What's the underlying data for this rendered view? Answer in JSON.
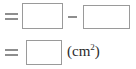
{
  "worksheet": {
    "name": "area-subtraction-answer-blanks",
    "background_color": "#ffffff",
    "box_border_color": "#9a9a9a",
    "operator_color": "#8e8e8e",
    "text_color": "#2b2b2b",
    "rows": [
      {
        "id": "equation-row-1",
        "equals_symbol": "=",
        "operator_symbol": "−",
        "operator_name": "minus-sign",
        "boxes": [
          {
            "name": "answer-box-1",
            "value": ""
          },
          {
            "name": "answer-box-2",
            "value": ""
          }
        ]
      },
      {
        "id": "equation-row-2",
        "equals_symbol": "=",
        "boxes": [
          {
            "name": "answer-box-3",
            "value": ""
          }
        ],
        "unit": {
          "open_paren": "(",
          "unit_text": "cm",
          "exponent": "2",
          "close_paren": ")"
        }
      }
    ]
  }
}
